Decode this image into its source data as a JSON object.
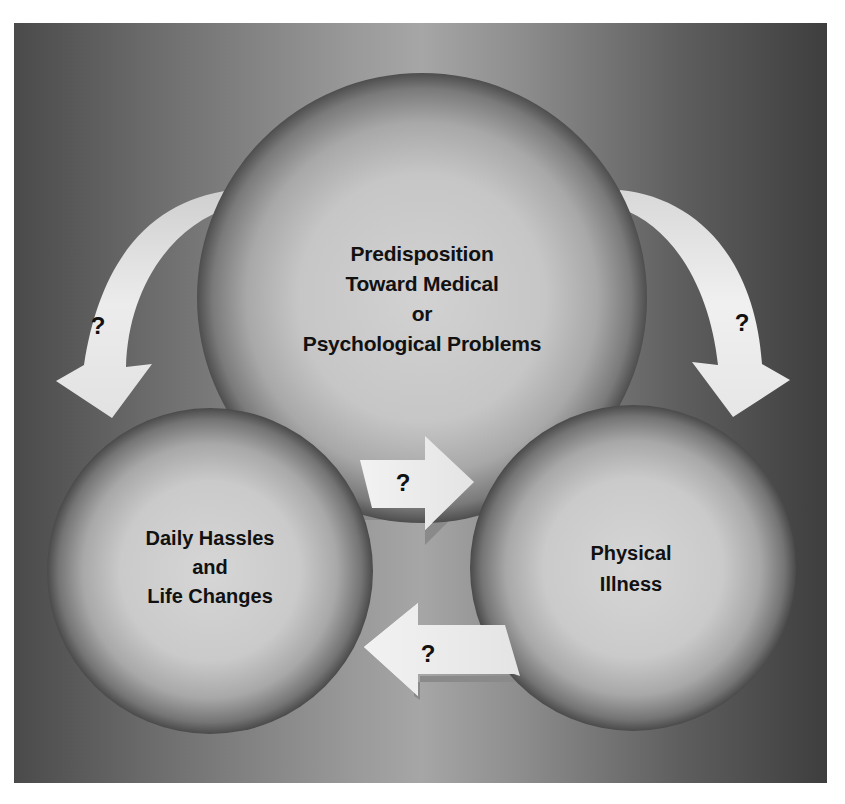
{
  "diagram": {
    "title": "",
    "colors": {
      "background_center": "#a6a6a6",
      "background_edge": "#3e3e3e",
      "circle_highlight": "#cfcfcf",
      "circle_shadow": "#555555",
      "arrow_fill": "#e6e6e6",
      "text": "#111111"
    },
    "nodes": {
      "top": {
        "lines": [
          "Predisposition",
          "Toward Medical",
          "or",
          "Psychological Problems"
        ]
      },
      "left": {
        "lines": [
          "Daily Hassles",
          "and",
          "Life Changes"
        ]
      },
      "right": {
        "lines": [
          "Physical",
          "Illness"
        ]
      }
    },
    "arrows": [
      {
        "id": "top-to-left",
        "from": "top",
        "to": "left",
        "label": "?",
        "shape": "curved"
      },
      {
        "id": "top-to-right",
        "from": "top",
        "to": "right",
        "label": "?",
        "shape": "curved"
      },
      {
        "id": "left-to-right",
        "from": "left",
        "to": "right",
        "label": "?",
        "shape": "straight"
      },
      {
        "id": "right-to-left",
        "from": "right",
        "to": "left",
        "label": "?",
        "shape": "straight"
      }
    ]
  }
}
